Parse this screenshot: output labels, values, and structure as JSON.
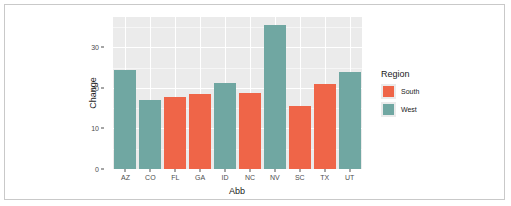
{
  "chart_data": {
    "type": "bar",
    "title": "",
    "subtitle": "",
    "xlabel": "Abb",
    "ylabel": "Change",
    "categories": [
      "AZ",
      "CO",
      "FL",
      "GA",
      "ID",
      "NC",
      "NV",
      "SC",
      "TX",
      "UT"
    ],
    "values": [
      24.5,
      17.0,
      17.8,
      18.4,
      21.3,
      18.7,
      35.5,
      15.5,
      20.9,
      24.0
    ],
    "group": [
      "West",
      "West",
      "South",
      "South",
      "West",
      "South",
      "West",
      "South",
      "South",
      "West"
    ],
    "ylim": [
      0,
      37.5
    ],
    "yticks": [
      0,
      10,
      20,
      30
    ],
    "ytick_labels": [
      "0",
      "10",
      "20",
      "30"
    ],
    "y_minor_ticks": [
      5,
      15,
      25,
      35
    ],
    "grid": true,
    "legend": {
      "title": "Region",
      "position": "right",
      "entries": [
        {
          "label": "South",
          "color": "#ef6548"
        },
        {
          "label": "West",
          "color": "#70a7a2"
        }
      ]
    },
    "colors": {
      "South": "#ef6548",
      "West": "#70a7a2",
      "panel_background": "#ebebeb",
      "gridline": "#ffffff",
      "axis_text": "#4d4d4d",
      "title_text": "#1a1a1a",
      "canvas": "#ffffff",
      "frame_border": "#c9c9c9"
    }
  }
}
